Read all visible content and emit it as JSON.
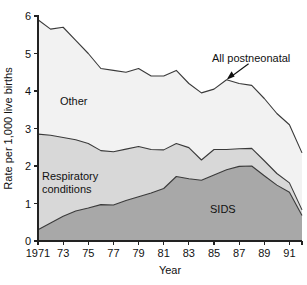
{
  "chart_data": {
    "type": "area",
    "stacked": true,
    "title": "",
    "subtitle": "",
    "xlabel": "Year",
    "ylabel": "Rate per 1,000 live births",
    "x": [
      1971,
      1972,
      1973,
      1974,
      1975,
      1976,
      1977,
      1978,
      1979,
      1980,
      1981,
      1982,
      1983,
      1984,
      1985,
      1986,
      1987,
      1988,
      1989,
      1990,
      1991,
      1992
    ],
    "xlim": [
      1971,
      1992
    ],
    "ylim": [
      0,
      6
    ],
    "xticks": [
      1971,
      1973,
      1975,
      1977,
      1979,
      1981,
      1983,
      1985,
      1987,
      1989,
      1991
    ],
    "xtick_labels": [
      "1971",
      "73",
      "75",
      "77",
      "79",
      "81",
      "83",
      "85",
      "87",
      "89",
      "91"
    ],
    "yticks": [
      0,
      1,
      2,
      3,
      4,
      5,
      6
    ],
    "ytick_labels": [
      "0",
      "1",
      "2",
      "3",
      "4",
      "5",
      "6"
    ],
    "grid": false,
    "legend_position": "in-plot-labels",
    "series": [
      {
        "name": "SIDS",
        "label": "SIDS",
        "color": "#a8a8a8",
        "stack_order": 1,
        "values": [
          0.3,
          0.48,
          0.66,
          0.8,
          0.88,
          0.97,
          0.96,
          1.08,
          1.18,
          1.28,
          1.4,
          1.72,
          1.66,
          1.62,
          1.76,
          1.9,
          1.99,
          2.0,
          1.74,
          1.49,
          1.3,
          0.68
        ]
      },
      {
        "name": "Respiratory conditions",
        "label": "Respiratory conditions",
        "color": "#d8d8d8",
        "stack_order": 2,
        "values": [
          2.55,
          2.34,
          2.1,
          1.9,
          1.72,
          1.44,
          1.42,
          1.37,
          1.34,
          1.16,
          1.03,
          0.88,
          0.83,
          0.54,
          0.68,
          0.54,
          0.47,
          0.47,
          0.4,
          0.31,
          0.25,
          0.15
        ]
      },
      {
        "name": "Other",
        "label": "Other",
        "color": "#f2f2f2",
        "stack_order": 3,
        "values": [
          3.05,
          2.83,
          2.94,
          2.65,
          2.4,
          2.19,
          2.17,
          2.05,
          2.08,
          1.96,
          1.97,
          1.95,
          1.71,
          1.79,
          1.61,
          1.86,
          1.74,
          1.68,
          1.66,
          1.6,
          1.55,
          1.52
        ]
      }
    ],
    "derived_total": {
      "name": "All postneonatal",
      "label": "All postneonatal",
      "values": [
        5.9,
        5.65,
        5.7,
        5.35,
        5.0,
        4.6,
        4.55,
        4.5,
        4.6,
        4.4,
        4.4,
        4.55,
        4.2,
        3.95,
        4.05,
        4.3,
        4.2,
        4.15,
        3.8,
        3.4,
        3.1,
        2.35
      ]
    },
    "annotations": [
      {
        "text": "All postneonatal",
        "points_to_year": 1986,
        "points_to_value": 4.3
      }
    ]
  },
  "labels": {
    "other": "Other",
    "respiratory_line1": "Respiratory",
    "respiratory_line2": "conditions",
    "sids": "SIDS",
    "all_postneonatal": "All postneonatal",
    "y_axis_title": "Rate per 1,000 live births",
    "x_axis_title": "Year"
  },
  "colors": {
    "sids_fill": "#a8a8a8",
    "respiratory_fill": "#d8d8d8",
    "other_fill": "#f2f2f2",
    "outline": "#3a3a3a",
    "axis": "#222222",
    "text": "#111111",
    "background": "#ffffff"
  }
}
